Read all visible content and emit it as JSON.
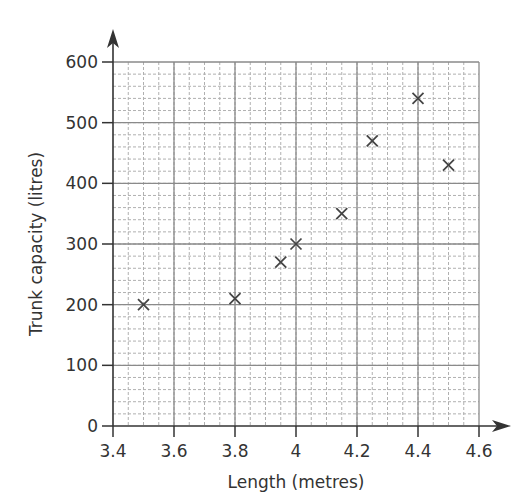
{
  "chart_data": {
    "type": "scatter",
    "title": "",
    "xlabel": "Length (metres)",
    "ylabel": "Trunk capacity (litres)",
    "xlim": [
      3.4,
      4.6
    ],
    "ylim": [
      0,
      600
    ],
    "x_ticks": [
      3.4,
      3.6,
      3.8,
      4,
      4.2,
      4.4,
      4.6
    ],
    "x_tick_labels": [
      "3.4",
      "3.6",
      "3.8",
      "4",
      "4.2",
      "4.4",
      "4.6"
    ],
    "y_ticks": [
      0,
      100,
      200,
      300,
      400,
      500,
      600
    ],
    "y_tick_labels": [
      "0",
      "100",
      "200",
      "300",
      "400",
      "500",
      "600"
    ],
    "x_minor_step": 0.05,
    "y_minor_step": 20,
    "grid": true,
    "marker": "x",
    "legend": null,
    "points": [
      {
        "x": 3.5,
        "y": 200
      },
      {
        "x": 3.8,
        "y": 210
      },
      {
        "x": 3.95,
        "y": 270
      },
      {
        "x": 4.0,
        "y": 300
      },
      {
        "x": 4.15,
        "y": 350
      },
      {
        "x": 4.25,
        "y": 470
      },
      {
        "x": 4.4,
        "y": 540
      },
      {
        "x": 4.5,
        "y": 430
      }
    ],
    "colors": {
      "axis": "#333333",
      "major_grid": "#8a8a8a",
      "minor_grid": "#b0b0b0",
      "marker": "#444444"
    }
  }
}
